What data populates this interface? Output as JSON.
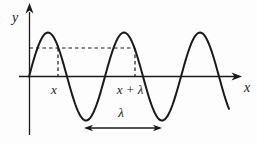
{
  "figure": {
    "background_color": "#fdfdfd",
    "ink_color": "#1a1a1a",
    "labels": {
      "y_axis": "y",
      "x_axis": "x",
      "point_x": "x",
      "point_x_plus_lambda": "x + λ",
      "wavelength": "λ"
    },
    "wave": {
      "type": "sine",
      "origin": {
        "x": 29,
        "y": 76.5
      },
      "amplitude": 44,
      "wavelength": 76,
      "x_end": 229
    },
    "markers": {
      "dashed_level_y": 48,
      "dashed_x1": 58,
      "dashed_x2": 135,
      "lambda_arrow": {
        "x1": 84,
        "x2": 162,
        "y": 128
      }
    },
    "axes": {
      "x_axis": {
        "x1": 19,
        "x2": 239,
        "y": 76.5,
        "arrow_tip_x": 242
      },
      "y_axis": {
        "x": 29.5,
        "y_top": 12,
        "y_bottom": 135,
        "arrow_tip_y": 3
      }
    }
  }
}
